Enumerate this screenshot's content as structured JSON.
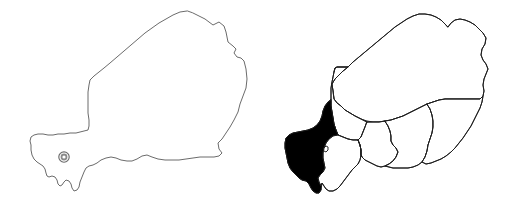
{
  "figure": {
    "background_color": "#ffffff",
    "width": 510,
    "height": 201,
    "panel_count": 2
  },
  "style": {
    "outline_stroke_color": "#5a5a5a",
    "region_stroke_color": "#1c1c1c",
    "highlight_fill_color": "#000000",
    "land_fill_color": "#ffffff",
    "capital_marker_color": "#6b6b6b"
  },
  "panels": [
    {
      "id": "outline-map",
      "name": "Niger country outline map",
      "label": "",
      "kind": "blank-outline",
      "features": [
        {
          "name": "country-outline",
          "label": "Niger",
          "type": "country-boundary",
          "fill": "#ffffff",
          "stroke": "#5a5a5a"
        },
        {
          "name": "capital-marker",
          "label": "Niamey",
          "type": "capital-city-marker",
          "symbol": "concentric-circle",
          "x": 64,
          "y": 157
        }
      ]
    },
    {
      "id": "regions-map",
      "name": "Niger administrative regions map",
      "label": "",
      "kind": "choropleth-highlight",
      "highlighted_region": "Tillaberi",
      "regions": [
        {
          "name": "tillaberi",
          "label": "Tillaberi",
          "highlighted": true,
          "fill": "#000000"
        },
        {
          "name": "agadez",
          "label": "Agadez",
          "highlighted": false,
          "fill": "#ffffff"
        },
        {
          "name": "tahoua",
          "label": "Tahoua",
          "highlighted": false,
          "fill": "#ffffff"
        },
        {
          "name": "dosso",
          "label": "Dosso",
          "highlighted": false,
          "fill": "#ffffff"
        },
        {
          "name": "maradi",
          "label": "Maradi",
          "highlighted": false,
          "fill": "#ffffff"
        },
        {
          "name": "zinder",
          "label": "Zinder",
          "highlighted": false,
          "fill": "#ffffff"
        },
        {
          "name": "diffa",
          "label": "Diffa",
          "highlighted": false,
          "fill": "#ffffff"
        },
        {
          "name": "niamey",
          "label": "Niamey",
          "highlighted": false,
          "fill": "#ffffff"
        }
      ]
    }
  ],
  "annotations": {
    "caption": "",
    "legend": "",
    "source_text": ""
  }
}
